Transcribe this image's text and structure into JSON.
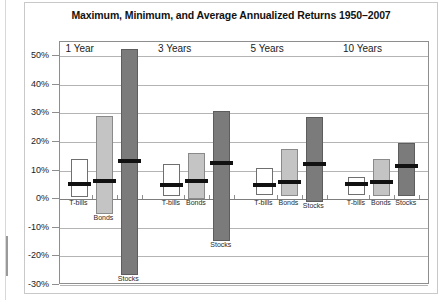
{
  "chart_data": {
    "type": "bar",
    "title": "Maximum, Minimum, and Average Annualized Returns 1950–2007",
    "xlabel": "",
    "ylabel": "",
    "ylim": [
      -30,
      55
    ],
    "grid": true,
    "legend": "none",
    "ytick_labels": [
      "50%",
      "40%",
      "30%",
      "20%",
      "10%",
      "0%",
      "-10%",
      "-20%",
      "-30%"
    ],
    "ytick_values": [
      50,
      40,
      30,
      20,
      10,
      0,
      -10,
      -20,
      -30
    ],
    "groups": [
      {
        "label": "1 Year",
        "bars": [
          {
            "name": "T-bills",
            "max": 14.0,
            "min": 0.9,
            "avg": 5.2,
            "style": "tbills"
          },
          {
            "name": "Bonds",
            "max": 29.1,
            "min": -5.1,
            "avg": 6.4,
            "style": "bonds"
          },
          {
            "name": "Stocks",
            "max": 52.6,
            "min": -26.5,
            "avg": 13.2,
            "style": "stocks"
          }
        ]
      },
      {
        "label": "3 Years",
        "bars": [
          {
            "name": "T-bills",
            "max": 12.5,
            "min": 1.2,
            "avg": 5.0,
            "style": "tbills"
          },
          {
            "name": "Bonds",
            "max": 16.3,
            "min": 0.1,
            "avg": 6.3,
            "style": "bonds"
          },
          {
            "name": "Stocks",
            "max": 30.8,
            "min": -14.6,
            "avg": 12.6,
            "style": "stocks"
          }
        ]
      },
      {
        "label": "5 Years",
        "bars": [
          {
            "name": "T-bills",
            "max": 11.1,
            "min": 1.5,
            "avg": 5.1,
            "style": "tbills"
          },
          {
            "name": "Bonds",
            "max": 17.4,
            "min": 1.0,
            "avg": 6.2,
            "style": "bonds"
          },
          {
            "name": "Stocks",
            "max": 28.6,
            "min": -1.0,
            "avg": 12.2,
            "style": "stocks"
          }
        ]
      },
      {
        "label": "10 Years",
        "bars": [
          {
            "name": "T-bills",
            "max": 7.7,
            "min": 1.6,
            "avg": 5.2,
            "style": "tbills"
          },
          {
            "name": "Bonds",
            "max": 14.1,
            "min": 1.1,
            "avg": 6.2,
            "style": "bonds"
          },
          {
            "name": "Stocks",
            "max": 19.5,
            "min": 1.2,
            "avg": 11.8,
            "style": "stocks"
          }
        ]
      }
    ],
    "colors": {
      "tbills": "#ffffff",
      "bonds": "#c4c4c4",
      "stocks": "#7b7b7b",
      "mean": "#111111",
      "grid": "#b4b4b4",
      "axis": "#8e8e8e"
    }
  }
}
